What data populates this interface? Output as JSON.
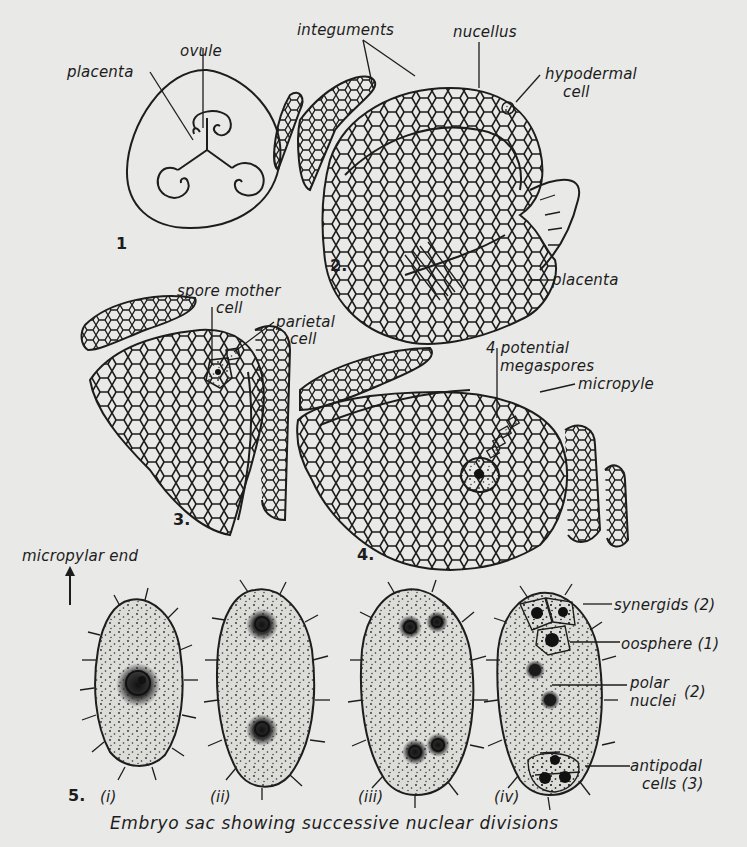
{
  "figure": {
    "caption": "Embryo sac showing successive nuclear divisions",
    "panels": [
      {
        "number": "1",
        "title": "Transverse section of ovary",
        "labels": {
          "ovule": "ovule",
          "placenta": "placenta"
        }
      },
      {
        "number": "2.",
        "title": "Young ovule",
        "labels": {
          "integuments": "integuments",
          "nucellus": "nucellus",
          "hypodermal_cell_line1": "hypodermal",
          "hypodermal_cell_line2": "cell",
          "placenta": "placenta"
        }
      },
      {
        "number": "3.",
        "title": "Spore mother cell stage",
        "labels": {
          "spore_mother_cell_line1": "spore mother",
          "spore_mother_cell_line2": "cell",
          "parietal_cell_line1": "parietal",
          "parietal_cell_line2": "cell"
        }
      },
      {
        "number": "4.",
        "title": "Megaspore stage",
        "labels": {
          "potential_megaspores_line1": "4 potential",
          "potential_megaspores_line2": "megaspores",
          "micropyle": "micropyle"
        }
      },
      {
        "number": "5.",
        "title": "Embryo sac",
        "orientation_label": "micropylar end",
        "stages": [
          "(i)",
          "(ii)",
          "(iii)",
          "(iv)"
        ],
        "labels": {
          "synergids": "synergids (2)",
          "oosphere": "oosphere (1)",
          "polar_nuclei_line1": "polar",
          "polar_nuclei_line2": "nuclei",
          "polar_nuclei_count": "(2)",
          "antipodal_cells_line1": "antipodal",
          "antipodal_cells_line2": "cells (3)"
        }
      }
    ]
  },
  "colors": {
    "paper": "#e9e9e7",
    "ink": "#1d1d1d",
    "sac_fill": "#d8d8d5"
  }
}
